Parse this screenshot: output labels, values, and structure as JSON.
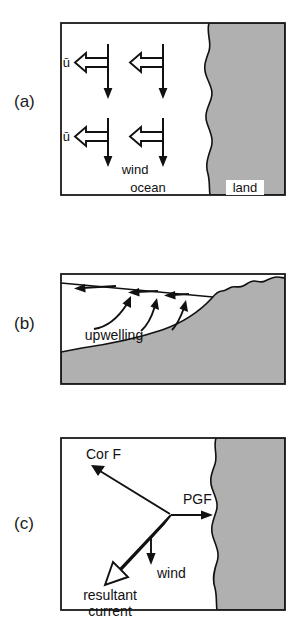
{
  "figure": {
    "background_color": "#ffffff",
    "land_fill": "#b0b0b0",
    "ocean_fill": "#ffffff",
    "stroke_color": "#111111"
  },
  "panels": [
    {
      "id": "a",
      "label": "(a)",
      "view": "map-view",
      "labels": {
        "ubar_top": "ū",
        "ubar_bottom": "ū",
        "wind": "wind",
        "ocean": "ocean",
        "land": "land"
      },
      "arrows": {
        "hollow_left_count": 4,
        "hollow_left_direction": "left",
        "thin_down_count": 4,
        "thin_down_direction": "down"
      }
    },
    {
      "id": "b",
      "label": "(b)",
      "view": "cross-section",
      "labels": {
        "upwelling": "upwelling"
      },
      "arrows": {
        "surface_left_count": 3,
        "surface_left_direction": "left",
        "upwelling_curved_count": 3,
        "upwelling_curved_direction": "up-right"
      }
    },
    {
      "id": "c",
      "label": "(c)",
      "view": "force-balance",
      "labels": {
        "coriolis": "Cor F",
        "pressure_gradient": "PGF",
        "wind": "wind",
        "resultant_line1": "resultant",
        "resultant_line2": "current"
      },
      "vectors": [
        {
          "name": "Cor F",
          "direction": "up-left",
          "style": "thin-solid"
        },
        {
          "name": "PGF",
          "direction": "right",
          "style": "thin-solid"
        },
        {
          "name": "wind",
          "direction": "down",
          "style": "thin-solid"
        },
        {
          "name": "resultant current",
          "direction": "down-left",
          "style": "hollow-outline"
        }
      ]
    }
  ]
}
